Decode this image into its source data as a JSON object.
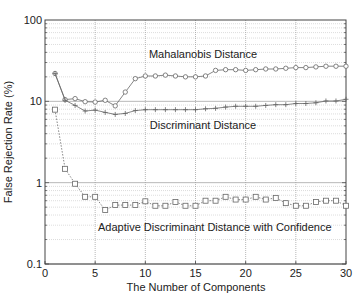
{
  "chart_data": {
    "type": "line",
    "title": "",
    "xlabel": "The Number of Components",
    "ylabel": "False Rejection Rate (%)",
    "xlim": [
      0,
      30
    ],
    "ylim": [
      0.1,
      100
    ],
    "yscale": "log",
    "grid": true,
    "legend": "none (inline annotations)",
    "x_ticks": [
      "0",
      "5",
      "10",
      "15",
      "20",
      "25",
      "30"
    ],
    "y_ticks": [
      "0.1",
      "1",
      "10",
      "100"
    ],
    "x": [
      1,
      2,
      3,
      4,
      5,
      6,
      7,
      8,
      9,
      10,
      11,
      12,
      13,
      14,
      15,
      16,
      17,
      18,
      19,
      20,
      21,
      22,
      23,
      24,
      25,
      26,
      27,
      28,
      29,
      30
    ],
    "series": [
      {
        "name": "Mahalanobis Distance",
        "marker": "diamond",
        "values": [
          22,
          10.5,
          10.8,
          9.9,
          9.8,
          10.3,
          8.8,
          13,
          19,
          20.5,
          20.5,
          21,
          20.5,
          20,
          20,
          20.5,
          24,
          24.5,
          24.5,
          24,
          24.5,
          25,
          25,
          25.5,
          26,
          26,
          26.5,
          27,
          27,
          27
        ]
      },
      {
        "name": "Discriminant Distance",
        "marker": "plus",
        "values": [
          22,
          10.3,
          8.9,
          7.6,
          7.8,
          7.3,
          6.9,
          7.1,
          7.7,
          7.9,
          7.9,
          7.9,
          7.9,
          7.9,
          7.9,
          8.1,
          8.2,
          8.5,
          8.7,
          8.7,
          8.7,
          8.9,
          9.1,
          9.1,
          9.4,
          9.4,
          9.6,
          10.1,
          10.1,
          10.6
        ]
      },
      {
        "name": "Adaptive Discriminant Distance with Confidence",
        "marker": "square",
        "linestyle": "dotted",
        "values": [
          7.9,
          1.48,
          0.97,
          0.67,
          0.67,
          0.46,
          0.53,
          0.53,
          0.53,
          0.59,
          0.52,
          0.52,
          0.58,
          0.52,
          0.52,
          0.6,
          0.6,
          0.67,
          0.62,
          0.62,
          0.67,
          0.62,
          0.65,
          0.56,
          0.52,
          0.52,
          0.58,
          0.6,
          0.6,
          0.52
        ]
      }
    ],
    "annotations": [
      {
        "text": "Mahalanobis Distance",
        "x": 15.5,
        "y": 38
      },
      {
        "text": "Discriminant Distance",
        "x": 15.5,
        "y": 5.2
      },
      {
        "text": "Adaptive Discriminant Distance with Confidence",
        "x": 5.5,
        "y": 0.32
      }
    ]
  },
  "labels": {
    "xlabel": "The Number of Components",
    "ylabel": "False Rejection Rate (%)",
    "annot_mahalanobis": "Mahalanobis Distance",
    "annot_discriminant": "Discriminant Distance",
    "annot_adaptive": "Adaptive Discriminant Distance with Confidence"
  }
}
